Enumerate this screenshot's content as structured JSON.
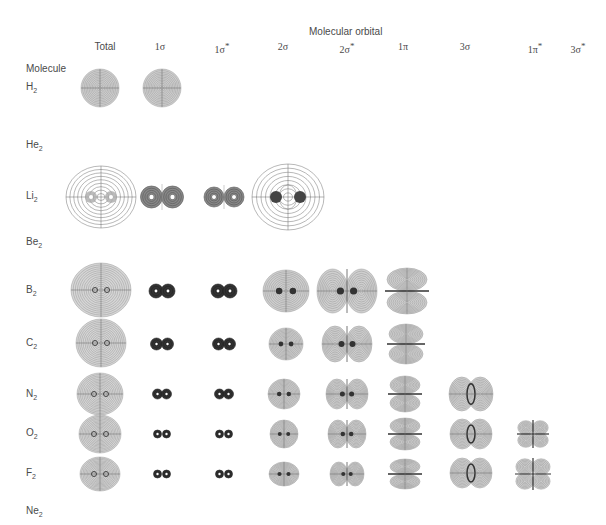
{
  "header": {
    "title": "Molecular orbital",
    "row_header": "Molecule"
  },
  "columns": [
    {
      "key": "total",
      "label": "Total",
      "sup": "",
      "x": 105
    },
    {
      "key": "1s",
      "label": "1σ",
      "sup": "",
      "x": 160
    },
    {
      "key": "1ss",
      "label": "1σ",
      "sup": "*",
      "x": 222
    },
    {
      "key": "2s",
      "label": "2σ",
      "sup": "",
      "x": 283
    },
    {
      "key": "2ss",
      "label": "2σ",
      "sup": "*",
      "x": 347
    },
    {
      "key": "1p",
      "label": "1π",
      "sup": "",
      "x": 403
    },
    {
      "key": "3s",
      "label": "3σ",
      "sup": "",
      "x": 465
    },
    {
      "key": "1ps",
      "label": "1π",
      "sup": "*",
      "x": 535
    },
    {
      "key": "3ss",
      "label": "3σ",
      "sup": "*",
      "x": 578
    }
  ],
  "rows": [
    {
      "label": "H",
      "sub": "2",
      "y": 88
    },
    {
      "label": "He",
      "sub": "2",
      "y": 146
    },
    {
      "label": "Li",
      "sub": "2",
      "y": 197
    },
    {
      "label": "Be",
      "sub": "2",
      "y": 243
    },
    {
      "label": "B",
      "sub": "2",
      "y": 291
    },
    {
      "label": "C",
      "sub": "2",
      "y": 344
    },
    {
      "label": "N",
      "sub": "2",
      "y": 395
    },
    {
      "label": "O",
      "sub": "2",
      "y": 434
    },
    {
      "label": "F",
      "sub": "2",
      "y": 474
    },
    {
      "label": "Ne",
      "sub": "2",
      "y": 512
    }
  ],
  "orbitals": [
    {
      "row": "H2",
      "col": "total",
      "type": "sphere",
      "cx": 100,
      "cy": 88,
      "rx": 19,
      "ry": 19
    },
    {
      "row": "H2",
      "col": "1s",
      "type": "sphere",
      "cx": 162,
      "cy": 88,
      "rx": 19,
      "ry": 19
    },
    {
      "row": "Li2",
      "col": "total",
      "type": "diffuse",
      "cx": 101,
      "cy": 197,
      "rx": 35,
      "ry": 31
    },
    {
      "row": "Li2",
      "col": "1s",
      "type": "pair",
      "cx": 162,
      "cy": 197,
      "r": 11,
      "sep": 21,
      "dark": false
    },
    {
      "row": "Li2",
      "col": "1ss",
      "type": "pair",
      "cx": 224,
      "cy": 197,
      "r": 10,
      "sep": 20,
      "dark": false
    },
    {
      "row": "Li2",
      "col": "2s",
      "type": "diffuse2",
      "cx": 288,
      "cy": 197,
      "rx": 36,
      "ry": 33
    },
    {
      "row": "B2",
      "col": "total",
      "type": "total",
      "cx": 101,
      "cy": 290,
      "rx": 30,
      "ry": 27
    },
    {
      "row": "B2",
      "col": "1s",
      "type": "pair",
      "cx": 162,
      "cy": 291,
      "r": 7,
      "sep": 12,
      "dark": true
    },
    {
      "row": "B2",
      "col": "1ss",
      "type": "pair",
      "cx": 224,
      "cy": 291,
      "r": 7,
      "sep": 12,
      "dark": true
    },
    {
      "row": "B2",
      "col": "2s",
      "type": "bond",
      "cx": 286,
      "cy": 291,
      "rx": 23,
      "ry": 21
    },
    {
      "row": "B2",
      "col": "2ss",
      "type": "anti",
      "cx": 347,
      "cy": 291,
      "rx": 30,
      "ry": 22
    },
    {
      "row": "B2",
      "col": "1p",
      "type": "pi",
      "cx": 407,
      "cy": 291,
      "rx": 20,
      "ry": 23
    },
    {
      "row": "C2",
      "col": "total",
      "type": "total",
      "cx": 101,
      "cy": 343,
      "rx": 25,
      "ry": 24
    },
    {
      "row": "C2",
      "col": "1s",
      "type": "pair",
      "cx": 162,
      "cy": 344,
      "r": 6,
      "sep": 11,
      "dark": true
    },
    {
      "row": "C2",
      "col": "1ss",
      "type": "pair",
      "cx": 224,
      "cy": 344,
      "r": 6,
      "sep": 11,
      "dark": true
    },
    {
      "row": "C2",
      "col": "2s",
      "type": "bond",
      "cx": 286,
      "cy": 344,
      "rx": 17,
      "ry": 16
    },
    {
      "row": "C2",
      "col": "2ss",
      "type": "anti",
      "cx": 347,
      "cy": 344,
      "rx": 25,
      "ry": 18
    },
    {
      "row": "C2",
      "col": "1p",
      "type": "pi",
      "cx": 406,
      "cy": 344,
      "rx": 17,
      "ry": 20
    },
    {
      "row": "N2",
      "col": "total",
      "type": "total",
      "cx": 100,
      "cy": 394,
      "rx": 23,
      "ry": 21
    },
    {
      "row": "N2",
      "col": "1s",
      "type": "pair",
      "cx": 162,
      "cy": 394,
      "r": 5,
      "sep": 9,
      "dark": true
    },
    {
      "row": "N2",
      "col": "1ss",
      "type": "pair",
      "cx": 224,
      "cy": 394,
      "r": 5,
      "sep": 9,
      "dark": true
    },
    {
      "row": "N2",
      "col": "2s",
      "type": "bond",
      "cx": 284,
      "cy": 394,
      "rx": 16,
      "ry": 15
    },
    {
      "row": "N2",
      "col": "2ss",
      "type": "anti",
      "cx": 347,
      "cy": 394,
      "rx": 21,
      "ry": 15
    },
    {
      "row": "N2",
      "col": "1p",
      "type": "pi",
      "cx": 405,
      "cy": 394,
      "rx": 15,
      "ry": 18
    },
    {
      "row": "N2",
      "col": "3s",
      "type": "sigma3",
      "cx": 471,
      "cy": 394,
      "rx": 22,
      "ry": 17
    },
    {
      "row": "O2",
      "col": "total",
      "type": "total",
      "cx": 100,
      "cy": 434,
      "rx": 21,
      "ry": 19
    },
    {
      "row": "O2",
      "col": "1s",
      "type": "pair",
      "cx": 162,
      "cy": 434,
      "r": 4,
      "sep": 9,
      "dark": true
    },
    {
      "row": "O2",
      "col": "1ss",
      "type": "pair",
      "cx": 224,
      "cy": 434,
      "r": 4,
      "sep": 9,
      "dark": true
    },
    {
      "row": "O2",
      "col": "2s",
      "type": "bond",
      "cx": 284,
      "cy": 434,
      "rx": 14,
      "ry": 14
    },
    {
      "row": "O2",
      "col": "2ss",
      "type": "anti",
      "cx": 347,
      "cy": 434,
      "rx": 19,
      "ry": 14
    },
    {
      "row": "O2",
      "col": "1p",
      "type": "pi",
      "cx": 405,
      "cy": 434,
      "rx": 15,
      "ry": 16
    },
    {
      "row": "O2",
      "col": "3s",
      "type": "sigma3",
      "cx": 471,
      "cy": 434,
      "rx": 21,
      "ry": 15
    },
    {
      "row": "O2",
      "col": "1ps",
      "type": "clover",
      "cx": 533,
      "cy": 434,
      "rx": 16,
      "ry": 14
    },
    {
      "row": "F2",
      "col": "total",
      "type": "total",
      "cx": 100,
      "cy": 474,
      "rx": 20,
      "ry": 17
    },
    {
      "row": "F2",
      "col": "1s",
      "type": "pair",
      "cx": 162,
      "cy": 474,
      "r": 4,
      "sep": 9,
      "dark": true
    },
    {
      "row": "F2",
      "col": "1ss",
      "type": "pair",
      "cx": 224,
      "cy": 474,
      "r": 4,
      "sep": 9,
      "dark": true
    },
    {
      "row": "F2",
      "col": "2s",
      "type": "bond",
      "cx": 284,
      "cy": 474,
      "rx": 15,
      "ry": 12
    },
    {
      "row": "F2",
      "col": "2ss",
      "type": "anti",
      "cx": 347,
      "cy": 474,
      "rx": 17,
      "ry": 12
    },
    {
      "row": "F2",
      "col": "1p",
      "type": "pi",
      "cx": 405,
      "cy": 474,
      "rx": 15,
      "ry": 15
    },
    {
      "row": "F2",
      "col": "3s",
      "type": "sigma3",
      "cx": 471,
      "cy": 473,
      "rx": 21,
      "ry": 15
    },
    {
      "row": "F2",
      "col": "1ps",
      "type": "clover",
      "cx": 533,
      "cy": 474,
      "rx": 18,
      "ry": 16
    }
  ],
  "colors": {
    "text": "#4a4a4a",
    "contour": "#777777",
    "fill": "#c8c8c8",
    "dark": "#333333"
  }
}
